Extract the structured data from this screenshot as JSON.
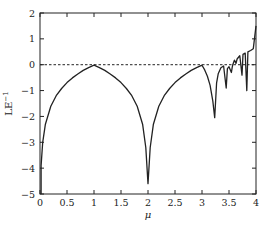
{
  "chart_data": {
    "type": "line",
    "title": "",
    "xlabel": "μ",
    "ylabel": "LE",
    "ylabel_superscript": "−1",
    "xlim": [
      0,
      4
    ],
    "ylim": [
      -5,
      2
    ],
    "xticks": [
      0,
      0.5,
      1,
      1.5,
      2,
      2.5,
      3,
      3.5,
      4
    ],
    "xtick_labels": [
      "0",
      "0.5",
      "1",
      "1.5",
      "2",
      "2.5",
      "3",
      "3.5",
      "4"
    ],
    "yticks": [
      2,
      1,
      0,
      -1,
      -2,
      -3,
      -4,
      -5
    ],
    "ytick_labels": [
      "2",
      "1",
      "0",
      "−1",
      "−2",
      "−3",
      "−4",
      "−5"
    ],
    "grid": false,
    "legend": null,
    "reference_line": {
      "y": 0,
      "style": "dashed"
    },
    "series": [
      {
        "name": "Lyapunov exponent",
        "x": [
          0.02,
          0.05,
          0.1,
          0.2,
          0.3,
          0.4,
          0.5,
          0.6,
          0.7,
          0.8,
          0.9,
          1.0,
          1.1,
          1.2,
          1.3,
          1.4,
          1.5,
          1.6,
          1.7,
          1.8,
          1.9,
          1.96,
          2.0,
          2.04,
          2.1,
          2.2,
          2.3,
          2.4,
          2.5,
          2.6,
          2.7,
          2.8,
          2.9,
          3.0,
          3.05,
          3.1,
          3.15,
          3.2,
          3.236,
          3.27,
          3.3,
          3.35,
          3.4,
          3.449,
          3.47,
          3.5,
          3.544,
          3.56,
          3.57,
          3.6,
          3.63,
          3.65,
          3.68,
          3.7,
          3.74,
          3.76,
          3.8,
          3.83,
          3.85,
          3.9,
          3.95,
          4.0
        ],
        "y": [
          -3.9,
          -3.0,
          -2.3,
          -1.61,
          -1.2,
          -0.92,
          -0.69,
          -0.51,
          -0.36,
          -0.22,
          -0.11,
          -0.02,
          -0.11,
          -0.22,
          -0.36,
          -0.51,
          -0.69,
          -0.92,
          -1.2,
          -1.61,
          -2.3,
          -3.2,
          -4.6,
          -3.2,
          -2.3,
          -1.61,
          -1.2,
          -0.92,
          -0.69,
          -0.51,
          -0.36,
          -0.22,
          -0.11,
          -0.02,
          -0.2,
          -0.45,
          -0.8,
          -1.4,
          -2.05,
          -0.7,
          -0.35,
          -0.12,
          -0.05,
          -0.9,
          -0.15,
          -0.08,
          -0.3,
          -0.1,
          0.0,
          0.18,
          0.05,
          0.22,
          0.3,
          0.35,
          -0.4,
          0.4,
          0.45,
          -1.0,
          0.5,
          0.55,
          0.62,
          1.5
        ]
      }
    ]
  }
}
